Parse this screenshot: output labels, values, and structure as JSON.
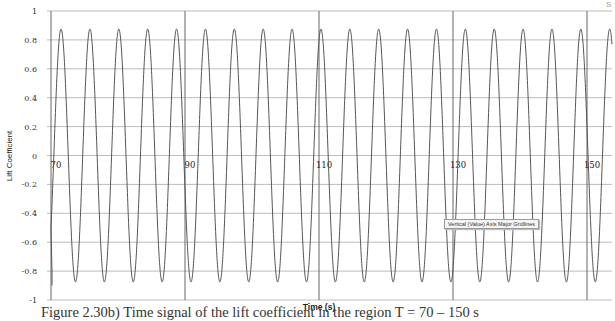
{
  "chart_data": {
    "type": "line",
    "title": "",
    "xlabel": "Time (s)",
    "ylabel": "Lift Coefficient",
    "xlim": [
      70,
      155
    ],
    "ylim": [
      -1,
      1
    ],
    "x_ticks": [
      "70",
      "90",
      "110",
      "130",
      "150"
    ],
    "y_ticks": [
      "1",
      "0.8",
      "0.6",
      "0.4",
      "0.2",
      "0",
      "-0.2",
      "-0.4",
      "-0.6",
      "-0.8",
      "-1"
    ],
    "grid": {
      "horizontal": true,
      "vertical": true
    },
    "legend": null,
    "series": [
      {
        "name": "Lift Coefficient",
        "amplitude": 0.875,
        "period_s": 4.31,
        "first_peak_t": 71.5,
        "peaks_t": [
          71.5,
          75.8,
          80.1,
          84.4,
          88.7,
          93.0,
          97.4,
          101.7,
          106.0,
          110.3,
          114.6,
          118.9,
          123.2,
          127.5,
          131.8,
          136.2,
          140.5,
          144.8
        ],
        "peak_value": 0.875,
        "trough_value": -0.875,
        "start_value": -0.8
      }
    ]
  },
  "caption": "Figure 2.30b) Time signal of the lift coefficient in the region T = 70 – 150 s",
  "tooltip": "Vertical (Value) Axis Major Gridlines",
  "corner_mark": "S"
}
